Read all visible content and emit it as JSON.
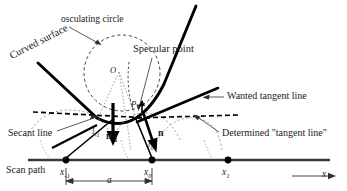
{
  "figure": {
    "width": 347,
    "height": 191,
    "background": "#ffffff",
    "ink_color": "#000000",
    "text_color": "#1a1a1a"
  },
  "annotations": {
    "osculating_circle": "osculating circle",
    "specular_point": "Specular point",
    "curved_surface": "Curved surface",
    "wanted_tangent_line": "Wanted tangent  line",
    "determined_tangent_line": "Determined  \"tangent  line\"",
    "secant_line": "Secant line",
    "scan_path": "Scan path"
  },
  "math_labels": {
    "center_O": "O",
    "point_P": "P",
    "length_l_minus1_base": "l",
    "length_l_minus1_sub": "-1",
    "length_l_zero_base": "l",
    "length_l_zero_sub": "0",
    "normal_minus1_base": "n",
    "normal_minus1_sub": "-1",
    "normal_zero": "n",
    "x_minus1_base": "x",
    "x_minus1_sub": "-1",
    "x_zero_base": "x",
    "x_zero_sub": "0",
    "x_one_base": "x",
    "x_one_sub": "1",
    "axis_x": "x",
    "spacing_a": "a"
  },
  "geometry": {
    "circle": {
      "cx": 122,
      "cy": 73,
      "r": 38,
      "style": "dashed"
    },
    "scan_path_line": {
      "x1": 28,
      "y1": 160,
      "x2": 330,
      "y2": 160
    },
    "scan_points": [
      {
        "name": "x-minus-1",
        "cx": 66,
        "cy": 160
      },
      {
        "name": "x-zero",
        "cx": 152,
        "cy": 160
      },
      {
        "name": "x-one",
        "cx": 228,
        "cy": 160
      }
    ],
    "dimension_a": {
      "x1": 66,
      "x2": 152,
      "y": 181
    },
    "axis_arrow": {
      "x1": 292,
      "x2": 335,
      "y": 176
    }
  }
}
